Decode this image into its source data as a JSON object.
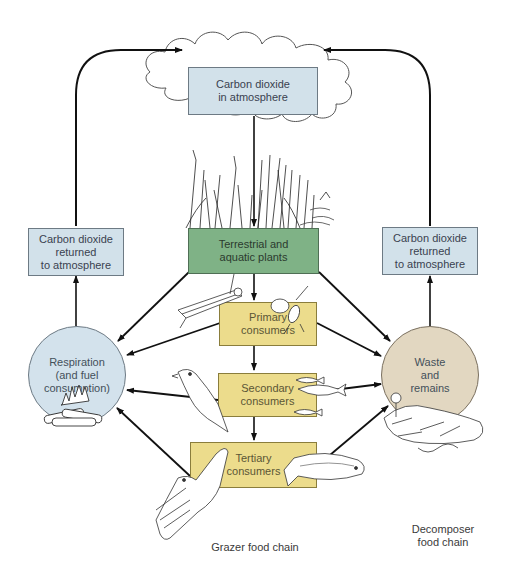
{
  "diagram": {
    "nodes": {
      "atmosphere": {
        "label": "Carbon dioxide\nin atmosphere",
        "color": "#d2e1ea"
      },
      "returned_left": {
        "label": "Carbon dioxide\nreturned\nto atmosphere",
        "color": "#d2e1ea"
      },
      "returned_right": {
        "label": "Carbon dioxide\nreturned\nto atmosphere",
        "color": "#d2e1ea"
      },
      "plants": {
        "label": "Terrestrial and\naquatic plants",
        "color": "#7fb286"
      },
      "primary": {
        "label": "Primary\nconsumers",
        "color": "#ecdc8c"
      },
      "secondary": {
        "label": "Secondary\nconsumers",
        "color": "#ecdc8c"
      },
      "tertiary": {
        "label": "Tertiary\nconsumers",
        "color": "#ecdc8c"
      },
      "respiration": {
        "label": "Respiration\n(and fuel\nconsumption)",
        "color": "#d3e2ec"
      },
      "waste": {
        "label": "Waste\nand\nremains",
        "color": "#e2d7c1"
      }
    },
    "captions": {
      "grazer": "Grazer food chain",
      "decomposer": "Decomposer\nfood chain"
    },
    "illustrations": [
      "cloud",
      "plants",
      "grasshopper",
      "aphids",
      "bird",
      "fish-school",
      "hawk",
      "trout",
      "campfire",
      "decomposer-debris"
    ],
    "edges": [
      [
        "atmosphere",
        "plants"
      ],
      [
        "returned_left",
        "atmosphere"
      ],
      [
        "returned_right",
        "atmosphere"
      ],
      [
        "respiration",
        "returned_left"
      ],
      [
        "waste",
        "returned_right"
      ],
      [
        "plants",
        "primary"
      ],
      [
        "primary",
        "secondary"
      ],
      [
        "secondary",
        "tertiary"
      ],
      [
        "plants",
        "respiration"
      ],
      [
        "plants",
        "waste"
      ],
      [
        "primary",
        "respiration"
      ],
      [
        "primary",
        "waste"
      ],
      [
        "secondary",
        "respiration"
      ],
      [
        "secondary",
        "waste"
      ],
      [
        "tertiary",
        "respiration"
      ],
      [
        "tertiary",
        "waste"
      ]
    ]
  }
}
